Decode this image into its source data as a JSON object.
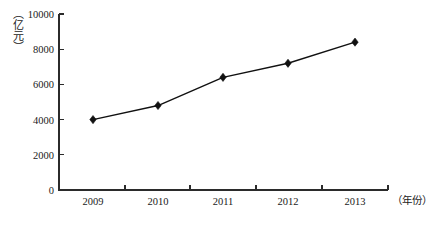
{
  "chart_data": {
    "type": "line",
    "title": "",
    "xlabel": "（年份）",
    "ylabel": "（亿元）",
    "categories": [
      "2009",
      "2010",
      "2011",
      "2012",
      "2013"
    ],
    "values": [
      4000,
      4800,
      6400,
      7200,
      8400
    ],
    "series": [
      {
        "name": "",
        "values": [
          4000,
          4800,
          6400,
          7200,
          8400
        ]
      }
    ],
    "ylim": [
      0,
      10000
    ],
    "ytick_labels": [
      "0",
      "2000",
      "4000",
      "6000",
      "8000",
      "10000"
    ],
    "ytick_values": [
      0,
      2000,
      4000,
      6000,
      8000,
      10000
    ],
    "xtick_labels": [
      "2009",
      "2010",
      "2011",
      "2012",
      "2013"
    ],
    "grid": false,
    "legend": false,
    "legend_position": "none",
    "marker": "diamond",
    "line_color": "#111111",
    "marker_color": "#111111",
    "axis_color": "#2b2b2b",
    "background_color": "#ffffff"
  },
  "axis": {
    "y_unit_label": "（亿元）",
    "x_unit_label": "（年份）"
  }
}
